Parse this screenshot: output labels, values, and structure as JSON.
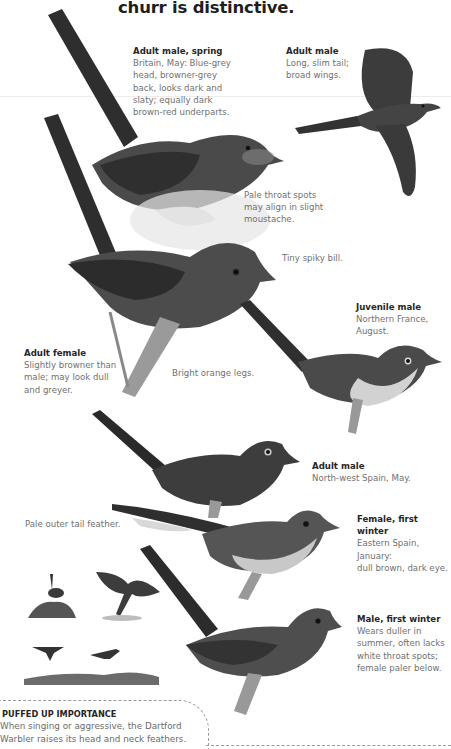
{
  "page": {
    "title": "churr is distinctive.",
    "colors": {
      "background": "#ffffff",
      "heading": "#1e1e1e",
      "body_text": "#707070",
      "bird_dark": "#3a3a3a"
    }
  },
  "captions": [
    {
      "id": "adult-male-spring",
      "heading": "Adult male, spring",
      "body": "Britain, May: Blue-grey\nhead, browner-grey\nback, looks dark and\nslaty; equally dark\nbrown-red underparts."
    },
    {
      "id": "adult-male-flight",
      "heading": "Adult male",
      "body": "Long, slim tail;\nbroad wings."
    },
    {
      "id": "juvenile-male",
      "heading": "Juvenile male",
      "body": "Northern France,\nAugust."
    },
    {
      "id": "adult-female",
      "heading": "Adult female",
      "body": "Slightly browner than\nmale; may look dull\nand greyer."
    },
    {
      "id": "adult-male-spain",
      "heading": "Adult male",
      "body": "North-west Spain, May."
    },
    {
      "id": "female-first-winter",
      "heading": "Female, first winter",
      "body": "Eastern Spain, January:\ndull brown, dark eye."
    },
    {
      "id": "male-first-winter",
      "heading": "Male, first winter",
      "body": "Wears duller in\nsummer, often lacks\nwhite throat spots;\nfemale paler below."
    }
  ],
  "notes": {
    "throat_spots": "Pale throat spots\nmay align in slight\nmoustache.",
    "bill": "Tiny spiky bill.",
    "legs": "Bright orange legs.",
    "tail_feather": "Pale outer tail feather."
  },
  "infobox": {
    "title": "PUFFED UP IMPORTANCE",
    "body": "When singing or aggressive, the Dartford\nWarbler raises its head and neck feathers."
  }
}
